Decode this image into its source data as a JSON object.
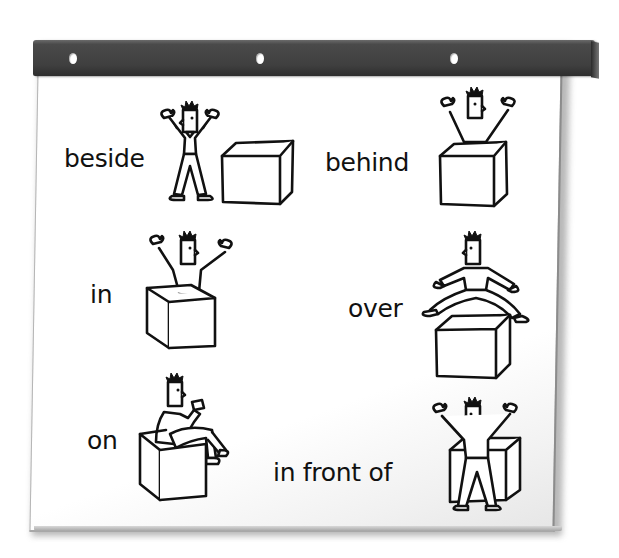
{
  "board": {
    "type": "flip-chart",
    "binding_bar_color": "#3f3f3f",
    "paper_color": "#ffffff",
    "binding_holes": 3
  },
  "prepositions": [
    {
      "id": "beside",
      "label": "beside",
      "illustration": "person-standing-beside-box-icon"
    },
    {
      "id": "behind",
      "label": "behind",
      "illustration": "person-behind-box-icon"
    },
    {
      "id": "in",
      "label": "in",
      "illustration": "person-in-box-icon"
    },
    {
      "id": "over",
      "label": "over",
      "illustration": "person-jumping-over-box-icon"
    },
    {
      "id": "on",
      "label": "on",
      "illustration": "person-sitting-on-box-icon"
    },
    {
      "id": "in-front-of",
      "label": "in front of",
      "illustration": "person-in-front-of-box-icon"
    }
  ]
}
